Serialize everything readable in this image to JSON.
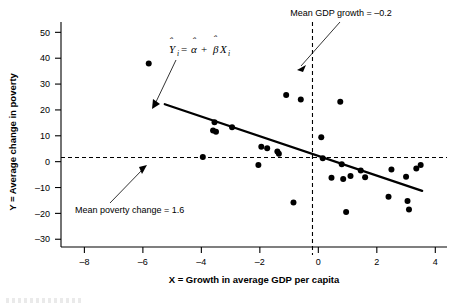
{
  "chart_data": {
    "type": "scatter",
    "title": "",
    "xlabel": "X = Growth in average GDP per capita",
    "ylabel": "Y = Average change in poverty",
    "xlim": [
      -8.8,
      4.4
    ],
    "ylim": [
      -33,
      54
    ],
    "xticks": [
      -8,
      -6,
      -4,
      -2,
      0,
      2,
      4
    ],
    "xtick_labels": [
      "–8",
      "–6",
      "–4",
      "–2",
      "0",
      "2",
      "4"
    ],
    "yticks": [
      -30,
      -20,
      -10,
      0,
      10,
      20,
      30,
      40,
      50
    ],
    "ytick_labels": [
      "–30",
      "–20",
      "–10",
      "0",
      "10",
      "20",
      "30",
      "40",
      "50"
    ],
    "grid": false,
    "legend": "none",
    "points": [
      {
        "x": -5.8,
        "y": 38.0
      },
      {
        "x": -3.95,
        "y": 1.8
      },
      {
        "x": -3.55,
        "y": 15.2
      },
      {
        "x": -3.6,
        "y": 12.0
      },
      {
        "x": -3.5,
        "y": 11.6
      },
      {
        "x": -2.95,
        "y": 13.3
      },
      {
        "x": -2.05,
        "y": -1.3
      },
      {
        "x": -1.95,
        "y": 5.8
      },
      {
        "x": -1.75,
        "y": 5.2
      },
      {
        "x": -1.4,
        "y": 3.9
      },
      {
        "x": -1.35,
        "y": 3.1
      },
      {
        "x": -1.1,
        "y": 25.8
      },
      {
        "x": -0.85,
        "y": -15.8
      },
      {
        "x": -0.6,
        "y": 24.0
      },
      {
        "x": 0.1,
        "y": 9.4
      },
      {
        "x": 0.15,
        "y": 1.3
      },
      {
        "x": 0.45,
        "y": -6.2
      },
      {
        "x": 0.75,
        "y": 23.2
      },
      {
        "x": 0.8,
        "y": -1.0
      },
      {
        "x": 0.85,
        "y": -6.7
      },
      {
        "x": 0.95,
        "y": -19.5
      },
      {
        "x": 1.1,
        "y": -5.5
      },
      {
        "x": 1.45,
        "y": -3.4
      },
      {
        "x": 1.6,
        "y": -6.0
      },
      {
        "x": 2.4,
        "y": -13.6
      },
      {
        "x": 2.5,
        "y": -3.0
      },
      {
        "x": 3.0,
        "y": -5.8
      },
      {
        "x": 3.05,
        "y": -15.2
      },
      {
        "x": 3.1,
        "y": -18.5
      },
      {
        "x": 3.35,
        "y": -2.6
      },
      {
        "x": 3.5,
        "y": -1.3
      }
    ],
    "regression_line": {
      "label": "Y-hat_i = alpha-hat + beta-hat X_i",
      "x_start": -5.25,
      "y_start": 22.2,
      "x_end": 3.55,
      "y_end": -11.3,
      "slope": -3.81,
      "intercept": 1.34
    },
    "mean_lines": {
      "vertical": {
        "value": -0.2,
        "label": "Mean GDP growth = –0.2"
      },
      "horizontal": {
        "value": 1.6,
        "label": "Mean poverty change = 1.6"
      }
    },
    "annotations": [
      {
        "name": "mean-gdp-growth-annotation",
        "text": "Mean GDP growth = –0.2"
      },
      {
        "name": "mean-poverty-change-annotation",
        "text": "Mean poverty change = 1.6"
      },
      {
        "name": "regression-equation-annotation",
        "text": "Ŷi = α̂ + β̂Xi"
      }
    ],
    "equation_parts": {
      "y_symbol": "Y",
      "y_sub": "i",
      "equals": "=",
      "alpha_symbol": "α",
      "plus": "+",
      "beta_symbol": "β",
      "x_symbol": "X",
      "x_sub": "i"
    },
    "colors": {
      "point": "#000000",
      "line": "#000000",
      "axis": "#000000",
      "background": "#ffffff"
    }
  }
}
